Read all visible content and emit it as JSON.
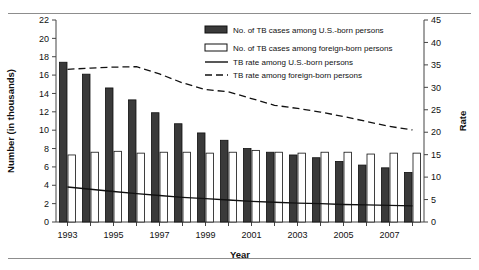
{
  "chart_data": {
    "type": "bar",
    "title": "",
    "xlabel": "Year",
    "ylabel": "Number (in thousands)",
    "y2label": "Rate",
    "grid": false,
    "legend_position": "top-right",
    "categories": [
      1993,
      1994,
      1995,
      1996,
      1997,
      1998,
      1999,
      2000,
      2001,
      2002,
      2003,
      2004,
      2005,
      2006,
      2007,
      2008
    ],
    "xtick_labels": [
      "1993",
      "1995",
      "1997",
      "1999",
      "2001",
      "2003",
      "2005",
      "2007"
    ],
    "xtick_years": [
      1993,
      1995,
      1997,
      1999,
      2001,
      2003,
      2005,
      2007
    ],
    "ylim": [
      0,
      22
    ],
    "yticks": [
      0,
      2,
      4,
      6,
      8,
      10,
      12,
      14,
      16,
      18,
      20,
      22
    ],
    "y2lim": [
      0,
      45
    ],
    "y2ticks": [
      0,
      5,
      10,
      15,
      20,
      25,
      30,
      35,
      40,
      45
    ],
    "series": [
      {
        "name": "No. of TB cases among U.S.-born persons",
        "kind": "bar",
        "axis": "left",
        "fill": "#3a3a3a",
        "values": [
          17.4,
          16.1,
          14.6,
          13.3,
          11.9,
          10.7,
          9.7,
          8.9,
          8.0,
          7.6,
          7.3,
          7.0,
          6.6,
          6.2,
          5.9,
          5.4
        ]
      },
      {
        "name": "No. of TB cases among foreign-born persons",
        "kind": "bar",
        "axis": "left",
        "fill": "#ffffff",
        "values": [
          7.3,
          7.6,
          7.7,
          7.5,
          7.6,
          7.6,
          7.5,
          7.6,
          7.8,
          7.6,
          7.5,
          7.6,
          7.6,
          7.4,
          7.5,
          7.5
        ]
      },
      {
        "name": "TB rate among U.S.-born persons",
        "kind": "line",
        "axis": "right",
        "style": "solid",
        "values": [
          7.8,
          7.3,
          6.8,
          6.3,
          5.9,
          5.5,
          5.2,
          4.9,
          4.6,
          4.4,
          4.2,
          4.1,
          3.9,
          3.8,
          3.7,
          3.6
        ]
      },
      {
        "name": "TB rate among foreign-born persons",
        "kind": "line",
        "axis": "right",
        "style": "dashed",
        "values": [
          34.0,
          34.3,
          34.5,
          34.6,
          33.0,
          31.0,
          29.5,
          29.0,
          27.5,
          26.0,
          25.3,
          24.5,
          23.5,
          22.4,
          21.3,
          20.5
        ]
      }
    ]
  },
  "legend": {
    "items": [
      {
        "label": "No. of TB cases among U.S.-born persons",
        "swatch": "filled-bar-swatch"
      },
      {
        "label": "No. of TB cases among foreign-born persons",
        "swatch": "open-bar-swatch"
      },
      {
        "label": "TB rate among U.S.-born persons",
        "swatch": "solid-line-swatch"
      },
      {
        "label": "TB rate among foreign-born persons",
        "swatch": "dashed-line-swatch"
      }
    ]
  }
}
